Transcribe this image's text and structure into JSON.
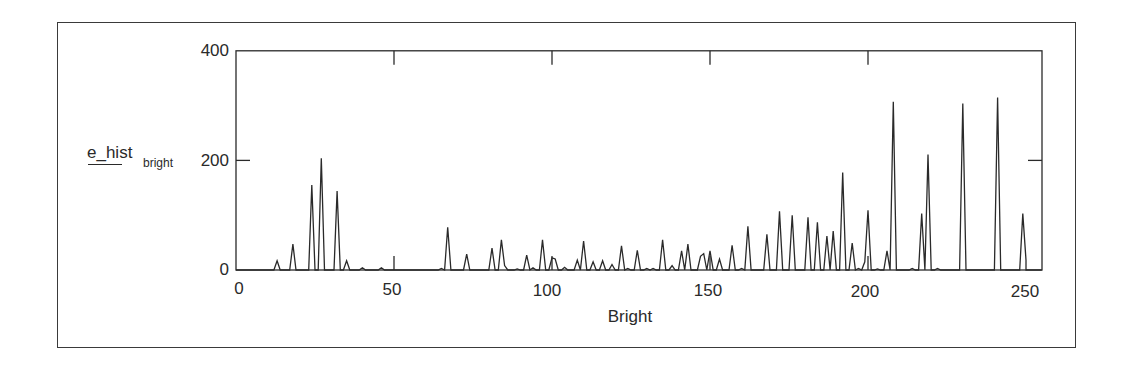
{
  "chart_data": {
    "type": "line",
    "title": "",
    "xlabel": "Bright",
    "ylabel": "e_hist",
    "ylabel_subscript": "bright",
    "xlim": [
      0,
      255
    ],
    "ylim": [
      0,
      400
    ],
    "x_ticks": [
      0,
      50,
      100,
      150,
      200,
      250
    ],
    "y_ticks": [
      0,
      200,
      400
    ],
    "x_tick_labels": [
      "0",
      "50",
      "100",
      "150",
      "200",
      "250"
    ],
    "y_tick_labels": [
      "0",
      "200",
      "400"
    ],
    "grid": false,
    "legend": null,
    "line_color": "#2a2a2a",
    "series": [
      {
        "name": "e_hist_bright",
        "points": [
          [
            0,
            0
          ],
          [
            12,
            0
          ],
          [
            13,
            17
          ],
          [
            14,
            0
          ],
          [
            17,
            0
          ],
          [
            18,
            47
          ],
          [
            19,
            0
          ],
          [
            23,
            0
          ],
          [
            24,
            155
          ],
          [
            25,
            0
          ],
          [
            26,
            0
          ],
          [
            27,
            204
          ],
          [
            28,
            0
          ],
          [
            31,
            0
          ],
          [
            32,
            144
          ],
          [
            33,
            0
          ],
          [
            34,
            0
          ],
          [
            35,
            17
          ],
          [
            36,
            0
          ],
          [
            39,
            0
          ],
          [
            40,
            4
          ],
          [
            41,
            0
          ],
          [
            45,
            0
          ],
          [
            46,
            4
          ],
          [
            47,
            0
          ],
          [
            64,
            0
          ],
          [
            65,
            3
          ],
          [
            66,
            0
          ],
          [
            67,
            78
          ],
          [
            68,
            0
          ],
          [
            72,
            0
          ],
          [
            73,
            29
          ],
          [
            74,
            0
          ],
          [
            80,
            0
          ],
          [
            81,
            40
          ],
          [
            82,
            0
          ],
          [
            83,
            0
          ],
          [
            84,
            55
          ],
          [
            85,
            8
          ],
          [
            86,
            0
          ],
          [
            88,
            0
          ],
          [
            89,
            2
          ],
          [
            90,
            0
          ],
          [
            91,
            0
          ],
          [
            92,
            27
          ],
          [
            93,
            0
          ],
          [
            94,
            4
          ],
          [
            95,
            0
          ],
          [
            96,
            0
          ],
          [
            97,
            55
          ],
          [
            98,
            0
          ],
          [
            99,
            0
          ],
          [
            100,
            22
          ],
          [
            101,
            20
          ],
          [
            102,
            0
          ],
          [
            103,
            0
          ],
          [
            104,
            5
          ],
          [
            105,
            0
          ],
          [
            107,
            0
          ],
          [
            108,
            18
          ],
          [
            109,
            0
          ],
          [
            110,
            53
          ],
          [
            111,
            0
          ],
          [
            112,
            0
          ],
          [
            113,
            15
          ],
          [
            114,
            0
          ],
          [
            115,
            0
          ],
          [
            116,
            17
          ],
          [
            117,
            0
          ],
          [
            118,
            0
          ],
          [
            119,
            10
          ],
          [
            120,
            0
          ],
          [
            121,
            0
          ],
          [
            122,
            44
          ],
          [
            123,
            0
          ],
          [
            124,
            3
          ],
          [
            125,
            0
          ],
          [
            126,
            0
          ],
          [
            127,
            36
          ],
          [
            128,
            0
          ],
          [
            129,
            0
          ],
          [
            130,
            3
          ],
          [
            131,
            0
          ],
          [
            132,
            3
          ],
          [
            133,
            0
          ],
          [
            134,
            0
          ],
          [
            135,
            55
          ],
          [
            136,
            0
          ],
          [
            137,
            0
          ],
          [
            138,
            8
          ],
          [
            139,
            0
          ],
          [
            140,
            0
          ],
          [
            141,
            35
          ],
          [
            142,
            0
          ],
          [
            143,
            47
          ],
          [
            144,
            0
          ],
          [
            146,
            0
          ],
          [
            147,
            25
          ],
          [
            148,
            30
          ],
          [
            149,
            0
          ],
          [
            150,
            35
          ],
          [
            151,
            0
          ],
          [
            152,
            0
          ],
          [
            153,
            20
          ],
          [
            154,
            0
          ],
          [
            156,
            0
          ],
          [
            157,
            45
          ],
          [
            158,
            0
          ],
          [
            159,
            0
          ],
          [
            160,
            3
          ],
          [
            161,
            0
          ],
          [
            162,
            80
          ],
          [
            163,
            0
          ],
          [
            167,
            0
          ],
          [
            168,
            65
          ],
          [
            169,
            0
          ],
          [
            171,
            0
          ],
          [
            172,
            107
          ],
          [
            173,
            0
          ],
          [
            175,
            0
          ],
          [
            176,
            100
          ],
          [
            177,
            0
          ],
          [
            180,
            0
          ],
          [
            181,
            96
          ],
          [
            182,
            0
          ],
          [
            183,
            0
          ],
          [
            184,
            87
          ],
          [
            185,
            0
          ],
          [
            186,
            0
          ],
          [
            187,
            62
          ],
          [
            188,
            0
          ],
          [
            189,
            71
          ],
          [
            190,
            0
          ],
          [
            191,
            0
          ],
          [
            192,
            178
          ],
          [
            193,
            0
          ],
          [
            194,
            0
          ],
          [
            195,
            49
          ],
          [
            196,
            0
          ],
          [
            197,
            3
          ],
          [
            198,
            0
          ],
          [
            199,
            15
          ],
          [
            200,
            109
          ],
          [
            201,
            0
          ],
          [
            202,
            0
          ],
          [
            203,
            2
          ],
          [
            204,
            0
          ],
          [
            205,
            0
          ],
          [
            206,
            35
          ],
          [
            207,
            0
          ],
          [
            208,
            307
          ],
          [
            209,
            0
          ],
          [
            213,
            0
          ],
          [
            214,
            3
          ],
          [
            215,
            0
          ],
          [
            216,
            0
          ],
          [
            217,
            103
          ],
          [
            218,
            0
          ],
          [
            219,
            211
          ],
          [
            220,
            0
          ],
          [
            221,
            0
          ],
          [
            222,
            3
          ],
          [
            223,
            0
          ],
          [
            229,
            0
          ],
          [
            230,
            304
          ],
          [
            231,
            0
          ],
          [
            240,
            0
          ],
          [
            241,
            315
          ],
          [
            242,
            0
          ],
          [
            248,
            0
          ],
          [
            249,
            103
          ],
          [
            250,
            18
          ],
          [
            250,
            0
          ],
          [
            255,
            0
          ]
        ]
      }
    ]
  }
}
